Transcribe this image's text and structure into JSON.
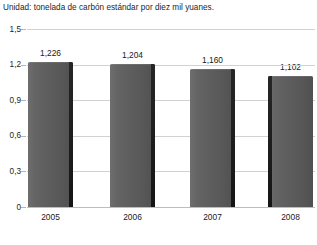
{
  "chart_data": {
    "type": "bar",
    "title": "Unidad: tonelada de carbón estándar por diez mil yuanes.",
    "xlabel": "",
    "ylabel": "",
    "categories": [
      "2005",
      "2006",
      "2007",
      "2008"
    ],
    "values": [
      1.226,
      1.204,
      1.16,
      1.102
    ],
    "value_labels": [
      "1,226",
      "1,204",
      "1,160",
      "1,102"
    ],
    "ylim": [
      0,
      1.5
    ],
    "ytick_values": [
      0,
      0.3,
      0.6,
      0.9,
      1.2,
      1.5
    ],
    "ytick_labels": [
      "0",
      "0,3",
      "0,6",
      "0,9",
      "1,2",
      "1,5"
    ],
    "grid": true,
    "legend": null,
    "series": [
      {
        "name": "Consumo de energía",
        "values": [
          1.226,
          1.204,
          1.16,
          1.102
        ]
      }
    ],
    "colors": {
      "bar_light": "#6e6e6e",
      "bar_dark": "#505050",
      "bar_edge": "#1d1d1d",
      "gridline": "#d2d2d4",
      "baseline": "#bdbdbf",
      "text": "#1a1a1a",
      "background": "#ffffff"
    }
  }
}
